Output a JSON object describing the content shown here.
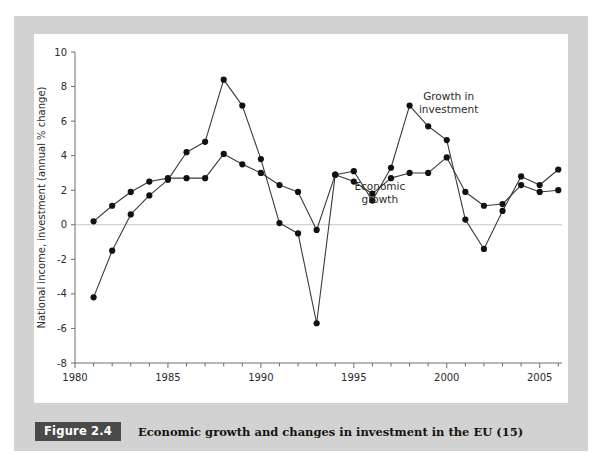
{
  "figure": {
    "badge_label": "Figure 2.4",
    "caption": "Economic growth and changes in investment in the EU (15)"
  },
  "colors": {
    "mat": "#d2d2d2",
    "canvas": "#ffffff",
    "badge_bg": "#4a4a4a",
    "badge_text": "#ffffff",
    "axis": "#6e6e6e",
    "zero_line": "#c6c6c6",
    "series_line": "#3a3a3a",
    "marker": "#111111"
  },
  "chart_data": {
    "type": "line",
    "title": "",
    "xlabel": "",
    "ylabel": "National income, investment (annual % change)",
    "xlim": [
      1980,
      2006.2
    ],
    "ylim": [
      -8,
      10
    ],
    "ytick_values": [
      -8,
      -6,
      -4,
      -2,
      0,
      2,
      4,
      6,
      8,
      10
    ],
    "ytick_labels": [
      "-8",
      "-6",
      "-4",
      "-2",
      "0",
      "2",
      "4",
      "6",
      "8",
      "10"
    ],
    "xtick_values": [
      1980,
      1985,
      1990,
      1995,
      2000,
      2005
    ],
    "xtick_labels": [
      "1980",
      "1985",
      "1990",
      "1995",
      "2000",
      "2005"
    ],
    "xminor_step": 1,
    "grid": false,
    "zero_line": true,
    "legend_position": "inline-annotations",
    "x": [
      1981,
      1982,
      1983,
      1984,
      1985,
      1986,
      1987,
      1988,
      1989,
      1990,
      1991,
      1992,
      1993,
      1994,
      1995,
      1996,
      1997,
      1998,
      1999,
      2000,
      2001,
      2002,
      2003,
      2004,
      2005,
      2006
    ],
    "series": [
      {
        "name": "Economic growth",
        "annotation": "Economic\ngrowth",
        "annotation_lines": [
          "Economic",
          "growth"
        ],
        "values": [
          0.2,
          1.1,
          1.9,
          2.5,
          2.7,
          2.7,
          2.7,
          4.1,
          3.5,
          3.0,
          2.3,
          1.9,
          -0.3,
          2.9,
          2.5,
          1.8,
          2.7,
          3.0,
          3.0,
          3.9,
          1.9,
          1.1,
          1.2,
          2.3,
          1.9,
          2.0
        ],
        "marker": "circle"
      },
      {
        "name": "Growth in investment",
        "annotation": "Growth in\ninvestment",
        "annotation_lines": [
          "Growth in",
          "investment"
        ],
        "values": [
          -4.2,
          -1.5,
          0.6,
          1.7,
          2.6,
          4.2,
          4.8,
          8.4,
          6.9,
          3.8,
          0.1,
          -0.5,
          -5.7,
          2.9,
          3.1,
          1.4,
          3.3,
          6.9,
          5.7,
          4.9,
          0.3,
          -1.4,
          0.8,
          2.8,
          2.3,
          3.2
        ],
        "marker": "circle"
      }
    ],
    "annotations": [
      {
        "text_lines": [
          "Growth in",
          "investment"
        ],
        "x": 2000.1,
        "y": 7.2,
        "series": "Growth in investment"
      },
      {
        "text_lines": [
          "Economic",
          "growth"
        ],
        "x": 1996.4,
        "y": 2.0,
        "series": "Economic growth"
      }
    ]
  }
}
